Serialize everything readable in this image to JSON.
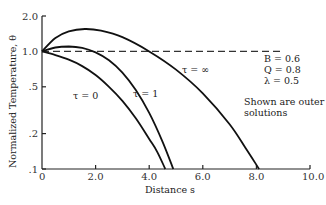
{
  "chart_data": {
    "type": "line",
    "title": "",
    "xlabel": "Distance s",
    "ylabel": "Normalized Temperature, θ",
    "xlim": [
      0,
      10
    ],
    "ylim": [
      0.1,
      2.0
    ],
    "yscale": "log",
    "x_ticks": [
      0,
      2.0,
      4.0,
      6.0,
      8.0,
      10.0
    ],
    "x_tick_labels": [
      "0",
      "2.0",
      "4.0",
      "6.0",
      "8.0",
      "10.0"
    ],
    "y_ticks": [
      0.1,
      0.2,
      0.5,
      1.0,
      2.0
    ],
    "y_tick_labels": [
      ".1",
      ".2",
      ".5",
      "1.0",
      "2.0"
    ],
    "grid": false,
    "reference_line": {
      "y": 1.0,
      "style": "dashed",
      "x_end": 9.0
    },
    "series": [
      {
        "name": "τ = 0",
        "label": "τ = 0",
        "x": [
          0,
          0.5,
          1.0,
          1.5,
          2.0,
          2.5,
          3.0,
          3.5,
          4.0,
          4.3,
          4.6
        ],
        "y": [
          1.0,
          0.93,
          0.85,
          0.75,
          0.63,
          0.5,
          0.38,
          0.27,
          0.18,
          0.14,
          0.1
        ]
      },
      {
        "name": "τ = 1",
        "label": "τ = 1",
        "x": [
          0,
          0.5,
          1.0,
          1.5,
          2.0,
          2.5,
          3.0,
          3.5,
          4.0,
          4.5,
          4.9
        ],
        "y": [
          1.0,
          1.08,
          1.1,
          1.07,
          0.98,
          0.84,
          0.66,
          0.47,
          0.3,
          0.17,
          0.1
        ]
      },
      {
        "name": "τ = ∞",
        "label": "τ = ∞",
        "x": [
          0,
          0.5,
          1.0,
          1.6,
          2.2,
          3.0,
          4.0,
          5.0,
          6.0,
          7.0,
          7.6,
          8.1
        ],
        "y": [
          1.0,
          1.3,
          1.48,
          1.55,
          1.5,
          1.32,
          1.0,
          0.7,
          0.44,
          0.24,
          0.15,
          0.1
        ]
      }
    ],
    "annotations": [
      {
        "text": "B = 0.6"
      },
      {
        "text": "Q = 0.8"
      },
      {
        "text": "λ = 0.5"
      },
      {
        "text": "Shown are outer"
      },
      {
        "text": "solutions"
      }
    ]
  }
}
